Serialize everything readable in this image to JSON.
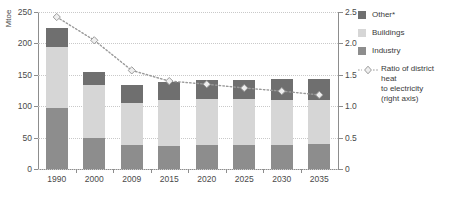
{
  "chart_data": {
    "type": "bar",
    "title": "",
    "subtitle": "",
    "xlabel": "",
    "ylabel": "Mtoe",
    "ylabel_right": "",
    "categories": [
      "1990",
      "2000",
      "2009",
      "2015",
      "2020",
      "2025",
      "2030",
      "2035"
    ],
    "ylim": [
      0,
      250
    ],
    "yticks": [
      "0",
      "50",
      "100",
      "150",
      "200",
      "250"
    ],
    "ytick_values": [
      0,
      50,
      100,
      150,
      200,
      250
    ],
    "ylim_right": [
      0,
      2.5
    ],
    "yticks_right": [
      "0",
      "0.5",
      "1.0",
      "1.5",
      "2.0",
      "2.5"
    ],
    "ytick_values_right": [
      0,
      0.5,
      1.0,
      1.5,
      2.0,
      2.5
    ],
    "grid": true,
    "stacked": true,
    "legend_position": "right",
    "series": [
      {
        "name": "Industry",
        "color": "#8d8d8d",
        "axis": "left",
        "values": [
          97,
          49,
          38,
          37,
          38,
          38,
          38,
          40
        ]
      },
      {
        "name": "Buildings",
        "color": "#d6d6d6",
        "axis": "left",
        "values": [
          98,
          84,
          67,
          73,
          73,
          73,
          72,
          70
        ]
      },
      {
        "name": "Other*",
        "color": "#6f6f6f",
        "axis": "left",
        "values": [
          30,
          21,
          28,
          29,
          30,
          31,
          33,
          34
        ]
      }
    ],
    "totals": [
      225,
      154,
      133,
      139,
      141,
      142,
      143,
      144
    ],
    "line_series": {
      "name": "Ratio of district heat to electricity (right axis)",
      "axis": "right",
      "marker": "diamond",
      "linestyle": "dotted",
      "color": "#9a9a9a",
      "marker_fill": "#efefef",
      "values": [
        2.42,
        2.05,
        1.57,
        1.4,
        1.35,
        1.29,
        1.24,
        1.18
      ]
    }
  },
  "legend": {
    "items": [
      {
        "label": "Other*",
        "swatch": "sw-other",
        "type": "swatch"
      },
      {
        "label": "Buildings",
        "swatch": "sw-buildings",
        "type": "swatch"
      },
      {
        "label": "Industry",
        "swatch": "sw-industry",
        "type": "swatch"
      }
    ],
    "line_item": {
      "label_line1": "Ratio of district heat",
      "label_line2": "to electricity",
      "label_line3": "(right axis)"
    }
  },
  "axis": {
    "left_title": "Mtoe"
  }
}
